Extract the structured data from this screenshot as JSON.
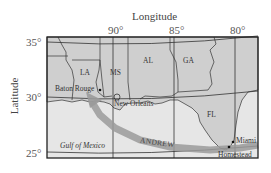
{
  "map": {
    "x_axis_title": "Longitude",
    "y_axis_title": "Latitude",
    "longitude_ticks": [
      "90°",
      "85°",
      "80°"
    ],
    "latitude_ticks": [
      "35°",
      "30°",
      "25°"
    ],
    "states": [
      "LA",
      "MS",
      "AL",
      "GA",
      "FL"
    ],
    "cities": [
      "Baton Rouge",
      "New Orleans",
      "Miami",
      "Homestead"
    ],
    "water_body": "Gulf of Mexico",
    "storm_track_label": "ANDREW",
    "colors": {
      "land": "#cfcfcf",
      "water": "#e6e6e6",
      "track": "#9a9a9a",
      "frame": "#222222"
    }
  }
}
